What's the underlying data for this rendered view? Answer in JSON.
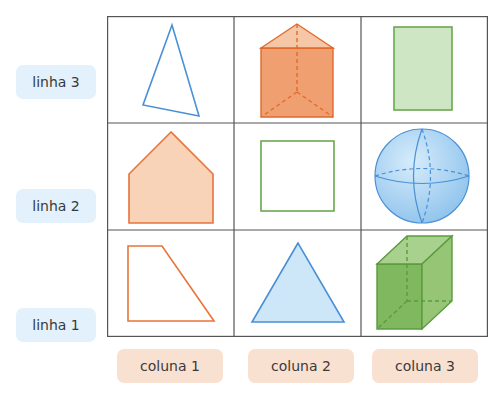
{
  "rows": [
    {
      "label": "linha 3"
    },
    {
      "label": "linha 2"
    },
    {
      "label": "linha 1"
    }
  ],
  "columns": [
    {
      "label": "coluna 1"
    },
    {
      "label": "coluna 2"
    },
    {
      "label": "coluna 3"
    }
  ],
  "cells": [
    {
      "row": "linha 3",
      "column": "coluna 1",
      "shape": "triangle-outline",
      "color": "#4a90d6"
    },
    {
      "row": "linha 3",
      "column": "coluna 2",
      "shape": "triangular-prism",
      "color": "#e8743a"
    },
    {
      "row": "linha 3",
      "column": "coluna 3",
      "shape": "rectangle-filled",
      "color": "#6aa84f"
    },
    {
      "row": "linha 2",
      "column": "coluna 1",
      "shape": "pentagon-filled",
      "color": "#e8743a"
    },
    {
      "row": "linha 2",
      "column": "coluna 2",
      "shape": "square-outline",
      "color": "#6aa84f"
    },
    {
      "row": "linha 2",
      "column": "coluna 3",
      "shape": "sphere",
      "color": "#4a90d6"
    },
    {
      "row": "linha 1",
      "column": "coluna 1",
      "shape": "trapezoid-outline",
      "color": "#e8743a"
    },
    {
      "row": "linha 1",
      "column": "coluna 2",
      "shape": "triangle-filled",
      "color": "#4a90d6"
    },
    {
      "row": "linha 1",
      "column": "coluna 3",
      "shape": "cube",
      "color": "#6aa84f"
    }
  ],
  "colors": {
    "grid_line": "#555555",
    "row_label_bg": "#e2f1fb",
    "col_label_bg": "#f9e1d2",
    "blue": "#4a90d6",
    "orange": "#e8743a",
    "green": "#6aa84f"
  }
}
